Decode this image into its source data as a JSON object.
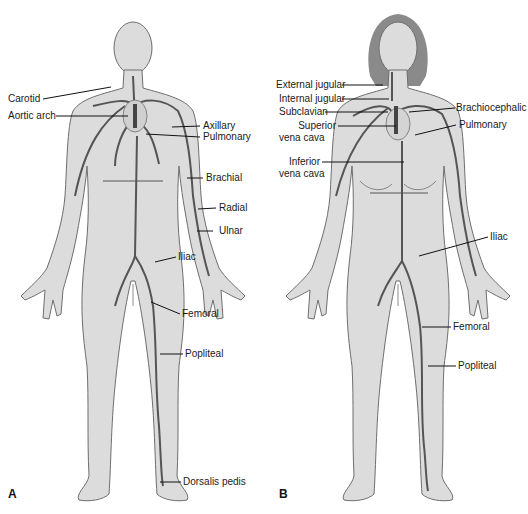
{
  "figure": {
    "panels": [
      {
        "letter": "A",
        "subject": "male figure — arterial system",
        "labels": {
          "carotid": "Carotid",
          "aortic_arch": "Aortic arch",
          "axillary": "Axillary",
          "pulmonary": "Pulmonary",
          "brachial": "Brachial",
          "radial": "Radial",
          "ulnar": "Ulnar",
          "iliac": "Iliac",
          "femoral": "Femoral",
          "popliteal": "Popliteal",
          "dorsalis_pedis": "Dorsalis pedis"
        }
      },
      {
        "letter": "B",
        "subject": "female figure — venous system",
        "labels": {
          "external_jugular": "External jugular",
          "internal_jugular": "Internal jugular",
          "subclavian": "Subclavian",
          "superior_vena_cava_1": "Superior",
          "superior_vena_cava_2": "vena cava",
          "inferior_vena_cava_1": "Inferior",
          "inferior_vena_cava_2": "vena cava",
          "brachiocephalic": "Brachiocephalic",
          "pulmonary": "Pulmonary",
          "iliac": "Iliac",
          "femoral": "Femoral",
          "popliteal": "Popliteal"
        }
      }
    ],
    "colors": {
      "skin": "#dcdcdc",
      "outline": "#6e6e6e",
      "vessel": "#555555",
      "hair": "#8a8a8a",
      "leader": "#111111"
    }
  }
}
